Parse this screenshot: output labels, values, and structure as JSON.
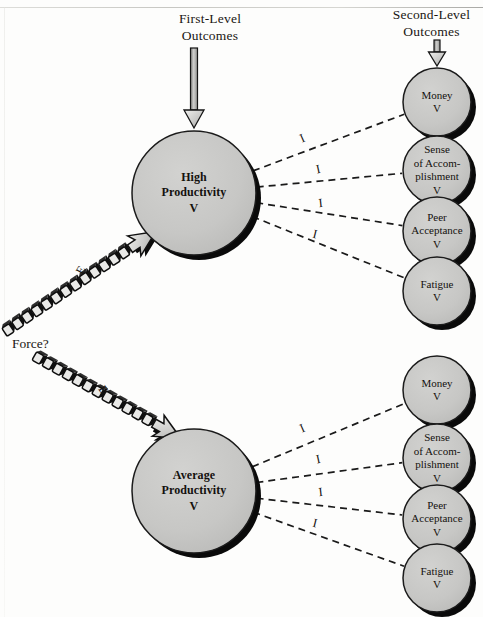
{
  "diagram": {
    "title_first_level": "First-Level\nOutcomes",
    "title_second_level": "Second-Level\nOutcomes",
    "force_label": "Force?",
    "expectancy_symbol": "E",
    "instrumentality_symbol": "I",
    "colors": {
      "node_fill": "#c6c6c4",
      "node_stroke": "#1b1b1b",
      "node_shadow": "#0a0a0a",
      "link_dashed": "#1a1a1a",
      "chain_fill": "#e9e9e7",
      "arrow_fill": "#d9d9d7",
      "page_background": "#fdfdfc",
      "text": "#15120f"
    },
    "first_level_nodes": [
      {
        "id": "high-productivity",
        "label": "High\nProductivity\nV",
        "cx": 194,
        "cy": 193,
        "r": 62
      },
      {
        "id": "average-productivity",
        "label": "Average\nProductivity\nV",
        "cx": 194,
        "cy": 491,
        "r": 62
      }
    ],
    "second_level_nodes": [
      {
        "id": "money-top",
        "label": "Money\nV",
        "cx": 437,
        "cy": 102,
        "r": 34
      },
      {
        "id": "sense-top",
        "label": "Sense\nof Accom-\nplishment\nV",
        "cx": 437,
        "cy": 170,
        "r": 34
      },
      {
        "id": "peer-top",
        "label": "Peer\nAcceptance\nV",
        "cx": 437,
        "cy": 231,
        "r": 34
      },
      {
        "id": "fatigue-top",
        "label": "Fatigue\nV",
        "cx": 437,
        "cy": 291,
        "r": 34
      },
      {
        "id": "money-bottom",
        "label": "Money\nV",
        "cx": 437,
        "cy": 390,
        "r": 34
      },
      {
        "id": "sense-bottom",
        "label": "Sense\nof Accom-\nplishment\nV",
        "cx": 437,
        "cy": 458,
        "r": 34
      },
      {
        "id": "peer-bottom",
        "label": "Peer\nAcceptance\nV",
        "cx": 437,
        "cy": 519,
        "r": 34
      },
      {
        "id": "fatigue-bottom",
        "label": "Fatigue\nV",
        "cx": 437,
        "cy": 578,
        "r": 34
      }
    ],
    "instrumentality_links": [
      {
        "from": "high-productivity",
        "to": "money-top",
        "label": "I",
        "lx": 304,
        "ly": 142,
        "angle": -24
      },
      {
        "from": "high-productivity",
        "to": "sense-top",
        "label": "I",
        "lx": 319,
        "ly": 173,
        "angle": -12
      },
      {
        "from": "high-productivity",
        "to": "peer-top",
        "label": "I",
        "lx": 321,
        "ly": 207,
        "angle": -6
      },
      {
        "from": "high-productivity",
        "to": "fatigue-top",
        "label": "I",
        "lx": 314,
        "ly": 238,
        "angle": 14
      },
      {
        "from": "average-productivity",
        "to": "money-bottom",
        "label": "I",
        "lx": 304,
        "ly": 432,
        "angle": -24
      },
      {
        "from": "average-productivity",
        "to": "sense-bottom",
        "label": "I",
        "lx": 319,
        "ly": 463,
        "angle": -12
      },
      {
        "from": "average-productivity",
        "to": "peer-bottom",
        "label": "I",
        "lx": 321,
        "ly": 496,
        "angle": -6
      },
      {
        "from": "average-productivity",
        "to": "fatigue-bottom",
        "label": "I",
        "lx": 314,
        "ly": 527,
        "angle": 14
      }
    ],
    "expectancy_links": [
      {
        "from": "force",
        "to": "high-productivity",
        "label": "E",
        "lx": 84,
        "ly": 272,
        "angle": -60
      },
      {
        "from": "force",
        "to": "average-productivity",
        "label": "E",
        "lx": 100,
        "ly": 392,
        "angle": 55
      }
    ],
    "top_arrow": {
      "id": "first-level-inflow-arrow",
      "x": 194,
      "from_y": 48,
      "to_y": 128
    },
    "second_arrow": {
      "id": "second-level-inflow-arrow",
      "x": 437,
      "from_y": 40,
      "to_y": 66
    }
  }
}
